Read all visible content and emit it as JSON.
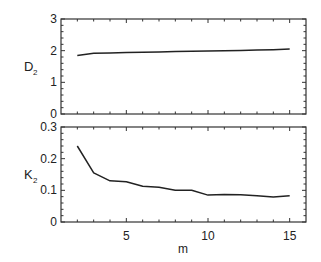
{
  "chart_data": [
    {
      "type": "line",
      "panel": "top",
      "title": "",
      "xlabel": "",
      "ylabel": "D",
      "ylabel_subscript": "2",
      "xlim": [
        1,
        16
      ],
      "ylim": [
        0,
        3
      ],
      "yticks": [
        "0",
        "1",
        "2",
        "3"
      ],
      "grid": false,
      "x": [
        2,
        3,
        4,
        5,
        6,
        7,
        8,
        9,
        10,
        11,
        12,
        13,
        14,
        15
      ],
      "series": [
        {
          "name": "D2",
          "values": [
            1.85,
            1.92,
            1.93,
            1.94,
            1.95,
            1.96,
            1.97,
            1.98,
            1.99,
            2.0,
            2.01,
            2.02,
            2.03,
            2.05
          ]
        }
      ]
    },
    {
      "type": "line",
      "panel": "bottom",
      "title": "",
      "xlabel": "m",
      "ylabel": "K",
      "ylabel_subscript": "2",
      "xlim": [
        1,
        16
      ],
      "ylim": [
        0,
        0.3
      ],
      "xticks": [
        "5",
        "10",
        "15"
      ],
      "yticks": [
        "0",
        "0.1",
        "0.2",
        "0.3"
      ],
      "grid": false,
      "x": [
        2,
        3,
        4,
        5,
        6,
        7,
        8,
        9,
        10,
        11,
        12,
        13,
        14,
        15
      ],
      "series": [
        {
          "name": "K2",
          "values": [
            0.24,
            0.155,
            0.13,
            0.127,
            0.113,
            0.11,
            0.1,
            0.1,
            0.085,
            0.087,
            0.086,
            0.083,
            0.079,
            0.083
          ]
        }
      ]
    }
  ],
  "colors": {
    "line": "#222222",
    "axis": "#333333",
    "background": "#ffffff"
  }
}
